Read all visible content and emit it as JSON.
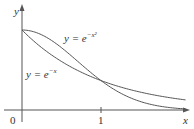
{
  "chart_data": {
    "type": "line",
    "title": "",
    "xlabel": "x",
    "ylabel": "y",
    "xlim": [
      0,
      2.07
    ],
    "ylim": [
      0,
      1.15
    ],
    "grid": false,
    "x_ticks": [
      "0",
      "1"
    ],
    "series": [
      {
        "name": "y = e^{-x^2}",
        "label_base": "y = e",
        "label_exp": "−x²",
        "x": [
          0,
          0.25,
          0.5,
          0.75,
          1,
          1.25,
          1.5,
          1.75,
          2
        ],
        "values": [
          1,
          0.939,
          0.779,
          0.57,
          0.368,
          0.21,
          0.105,
          0.047,
          0.018
        ]
      },
      {
        "name": "y = e^{-x}",
        "label_base": "y = e",
        "label_exp": "−x",
        "x": [
          0,
          0.25,
          0.5,
          0.75,
          1,
          1.25,
          1.5,
          1.75,
          2
        ],
        "values": [
          1,
          0.779,
          0.607,
          0.472,
          0.368,
          0.287,
          0.223,
          0.174,
          0.135
        ]
      }
    ],
    "annotations": [
      "y = e^{-x^2}",
      "y = e^{-x}"
    ]
  },
  "labels": {
    "y_axis": "y",
    "x_axis": "x",
    "origin": "0",
    "x_tick_1": "1",
    "gauss_base": "y = e",
    "gauss_exp": "−x²",
    "exp_base": "y = e",
    "exp_exp": "−x"
  }
}
